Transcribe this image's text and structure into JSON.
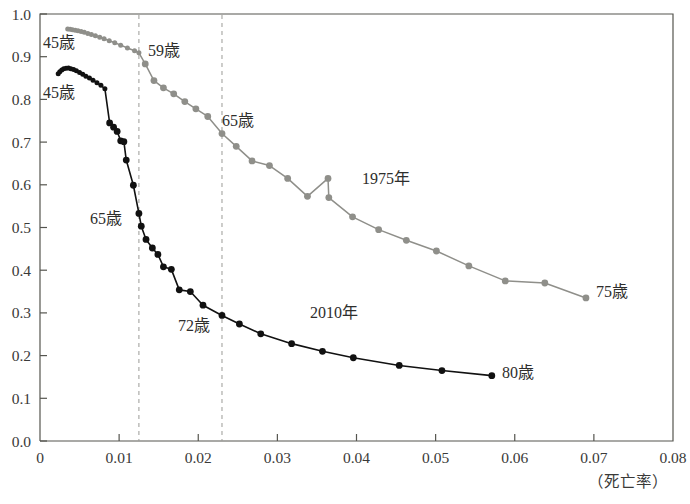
{
  "chart_data": {
    "type": "line",
    "title": "",
    "xlabel": "（死亡率）",
    "ylabel": "",
    "xlim": [
      0,
      0.08
    ],
    "ylim": [
      0,
      1.0
    ],
    "xticks": [
      "0",
      "0.01",
      "0.02",
      "0.03",
      "0.04",
      "0.05",
      "0.06",
      "0.07",
      "0.08"
    ],
    "xtick_values": [
      0,
      0.01,
      0.02,
      0.03,
      0.04,
      0.05,
      0.06,
      0.07,
      0.08
    ],
    "yticks": [
      "0.0",
      "0.1",
      "0.2",
      "0.3",
      "0.4",
      "0.5",
      "0.6",
      "0.7",
      "0.8",
      "0.9",
      "1.0"
    ],
    "ytick_values": [
      0.0,
      0.1,
      0.2,
      0.3,
      0.4,
      0.5,
      0.6,
      0.7,
      0.8,
      0.9,
      1.0
    ],
    "grid": false,
    "legend_position": "inline-annotations",
    "series": [
      {
        "name": "1975年",
        "color": "#8f8f8a",
        "label": "1975年",
        "start_label": "45歳",
        "end_label": "75歳",
        "points": [
          [
            0.0035,
            0.965
          ],
          [
            0.0038,
            0.964
          ],
          [
            0.0041,
            0.963
          ],
          [
            0.00445,
            0.962
          ],
          [
            0.0048,
            0.9605
          ],
          [
            0.0052,
            0.959
          ],
          [
            0.0056,
            0.957
          ],
          [
            0.00605,
            0.9545
          ],
          [
            0.0065,
            0.952
          ],
          [
            0.007,
            0.949
          ],
          [
            0.00755,
            0.9455
          ],
          [
            0.0081,
            0.942
          ],
          [
            0.00875,
            0.9375
          ],
          [
            0.00945,
            0.9325
          ],
          [
            0.0102,
            0.927
          ],
          [
            0.01105,
            0.9205
          ],
          [
            0.01195,
            0.914
          ],
          [
            0.0125,
            0.909
          ],
          [
            0.0133,
            0.883
          ],
          [
            0.0144,
            0.844
          ],
          [
            0.0156,
            0.827
          ],
          [
            0.0169,
            0.813
          ],
          [
            0.0183,
            0.795
          ],
          [
            0.0197,
            0.778
          ],
          [
            0.0212,
            0.76
          ],
          [
            0.023,
            0.72
          ],
          [
            0.0248,
            0.69
          ],
          [
            0.0268,
            0.656
          ],
          [
            0.029,
            0.645
          ],
          [
            0.0313,
            0.615
          ],
          [
            0.0338,
            0.573
          ],
          [
            0.0364,
            0.615
          ],
          [
            0.0365,
            0.57
          ],
          [
            0.0395,
            0.525
          ],
          [
            0.0428,
            0.495
          ],
          [
            0.0463,
            0.47
          ],
          [
            0.0501,
            0.445
          ],
          [
            0.0542,
            0.41
          ],
          [
            0.0588,
            0.375
          ],
          [
            0.0638,
            0.37
          ],
          [
            0.069,
            0.335
          ]
        ]
      },
      {
        "name": "2010年",
        "color": "#111111",
        "label": "2010年",
        "start_label": "45歳",
        "mid_label_65": "65歳",
        "mid_label_72": "72歳",
        "end_label": "80歳",
        "points": [
          [
            0.0023,
            0.86
          ],
          [
            0.0025,
            0.865
          ],
          [
            0.00275,
            0.869
          ],
          [
            0.003,
            0.8715
          ],
          [
            0.0033,
            0.873
          ],
          [
            0.0036,
            0.8735
          ],
          [
            0.0039,
            0.872
          ],
          [
            0.00425,
            0.87
          ],
          [
            0.0046,
            0.867
          ],
          [
            0.005,
            0.863
          ],
          [
            0.0054,
            0.859
          ],
          [
            0.0058,
            0.8545
          ],
          [
            0.00625,
            0.85
          ],
          [
            0.0067,
            0.845
          ],
          [
            0.0072,
            0.839
          ],
          [
            0.0077,
            0.833
          ],
          [
            0.0082,
            0.825
          ],
          [
            0.0088,
            0.745
          ],
          [
            0.0093,
            0.735
          ],
          [
            0.00975,
            0.725
          ],
          [
            0.0102,
            0.703
          ],
          [
            0.0106,
            0.701
          ],
          [
            0.0109,
            0.658
          ],
          [
            0.0118,
            0.599
          ],
          [
            0.0125,
            0.533
          ],
          [
            0.0128,
            0.503
          ],
          [
            0.0134,
            0.472
          ],
          [
            0.0142,
            0.452
          ],
          [
            0.0149,
            0.437
          ],
          [
            0.0156,
            0.408
          ],
          [
            0.0166,
            0.402
          ],
          [
            0.0176,
            0.354
          ],
          [
            0.019,
            0.35
          ],
          [
            0.0206,
            0.318
          ],
          [
            0.023,
            0.294
          ],
          [
            0.0252,
            0.274
          ],
          [
            0.0279,
            0.251
          ],
          [
            0.0318,
            0.228
          ],
          [
            0.0357,
            0.21
          ],
          [
            0.0396,
            0.195
          ],
          [
            0.0454,
            0.177
          ],
          [
            0.0508,
            0.165
          ],
          [
            0.0571,
            0.153
          ]
        ]
      }
    ],
    "reference_lines": [
      {
        "name": "dashed-line-1",
        "x": 0.0125,
        "style": "dashed"
      },
      {
        "name": "dashed-line-2",
        "x": 0.023,
        "style": "dashed"
      }
    ],
    "annotations": [
      {
        "id": "a-1975-45",
        "text": "45歳",
        "x_px": 43,
        "y_px": 48
      },
      {
        "id": "a-2010-45",
        "text": "45歳",
        "x_px": 43,
        "y_px": 98
      },
      {
        "id": "a-1975-59",
        "text": "59歳",
        "x_px": 148,
        "y_px": 56
      },
      {
        "id": "a-1975-65",
        "text": "65歳",
        "x_px": 222,
        "y_px": 126
      },
      {
        "id": "a-2010-65",
        "text": "65歳",
        "x_px": 90,
        "y_px": 224
      },
      {
        "id": "a-2010-72",
        "text": "72歳",
        "x_px": 178,
        "y_px": 331
      },
      {
        "id": "a-1975-label",
        "text": "1975年",
        "x_px": 362,
        "y_px": 184
      },
      {
        "id": "a-2010-label",
        "text": "2010年",
        "x_px": 310,
        "y_px": 318
      },
      {
        "id": "a-1975-75",
        "text": "75歳",
        "x_px": 596,
        "y_px": 297
      },
      {
        "id": "a-2010-80",
        "text": "80歳",
        "x_px": 502,
        "y_px": 378
      }
    ]
  },
  "figure": {
    "x_axis_caption": "（死亡率）",
    "frame_color": "#55554f",
    "background": "#ffffff"
  }
}
